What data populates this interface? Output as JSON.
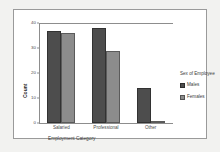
{
  "chart_data": {
    "type": "bar",
    "title": "",
    "categories": [
      "Salaried",
      "Professional",
      "Other"
    ],
    "series": [
      {
        "name": "Males",
        "values": [
          37,
          38,
          14
        ],
        "color": "#4d4d4d"
      },
      {
        "name": "Females",
        "values": [
          36,
          29,
          1
        ],
        "color": "#8c8c8c"
      }
    ],
    "xlabel": "Employment Category",
    "ylabel": "Count",
    "ylim": [
      0,
      40
    ],
    "yticks": [
      0,
      10,
      20,
      30,
      40
    ],
    "ytick_labels": [
      "0",
      "10",
      "20",
      "30",
      "40"
    ],
    "grid": false,
    "legend": {
      "title": "Sex of Employee",
      "position": "right"
    }
  },
  "figure": {
    "background": "#ffffff",
    "border_color": "#9a9a9a",
    "page_background": "#f2f2f0"
  }
}
